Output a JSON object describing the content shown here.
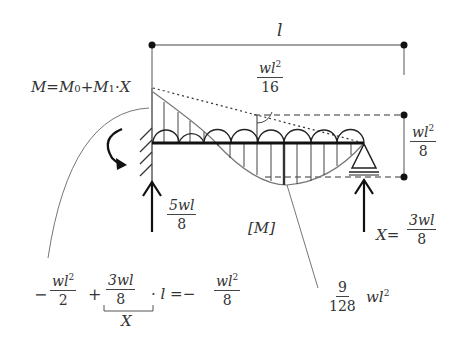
{
  "diagram": {
    "title_span": "l",
    "equation_M": {
      "M": "M",
      "eq": "=",
      "M0": "M",
      "M0_sub": "0",
      "plus": "+",
      "M1": "M",
      "M1_sub": "1",
      "dot": "·",
      "X": "X"
    },
    "label_wl2_16": {
      "num": "wl",
      "num_sup": "2",
      "den": "16"
    },
    "label_wl2_8": {
      "num": "wl",
      "num_sup": "2",
      "den": "8"
    },
    "reaction_left": {
      "num": "5wl",
      "den": "8"
    },
    "reaction_right": {
      "prefix": "X=",
      "num": "3wl",
      "den": "8"
    },
    "moment_diagram_label": "[M]",
    "max_moment": {
      "num": "9",
      "den": "128",
      "suffix": "wl",
      "suffix_sup": "2"
    },
    "bottom_equation": {
      "minus1": "−",
      "t1_num": "wl",
      "t1_sup": "2",
      "t1_den": "2",
      "plus": "+",
      "t2_num": "3wl",
      "t2_den": "8",
      "dot_l": "· l =−",
      "t3_num": "wl",
      "t3_sup": "2",
      "t3_den": "8",
      "bracket_label": "X"
    },
    "colors": {
      "line": "#222222",
      "thin": "#666666",
      "background": "#ffffff"
    }
  }
}
